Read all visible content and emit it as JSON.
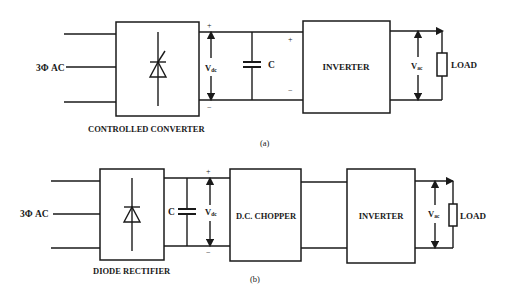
{
  "diagram_a": {
    "input_label": "3Φ AC",
    "converter_label": "CONTROLLED CONVERTER",
    "vdc_label": "V",
    "vdc_sub": "dc",
    "capacitor_label": "C",
    "plus": "+",
    "minus": "−",
    "inverter_label": "INVERTER",
    "vac_label": "V",
    "vac_sub": "ac",
    "load_label": "LOAD",
    "caption": "(a)"
  },
  "diagram_b": {
    "input_label": "3Φ AC",
    "rectifier_label": "DIODE RECTIFIER",
    "capacitor_label": "C",
    "vdc_label": "V",
    "vdc_sub": "dc",
    "plus": "+",
    "minus": "−",
    "chopper_label": "D.C. CHOPPER",
    "inverter_label": "INVERTER",
    "vac_label": "V",
    "vac_sub": "ac",
    "load_label": "LOAD",
    "caption": "(b)"
  },
  "colors": {
    "line": "#1a1a1a",
    "background": "#ffffff"
  }
}
